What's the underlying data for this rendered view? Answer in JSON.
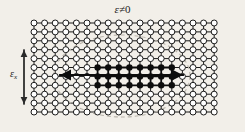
{
  "figure": {
    "kind": "lattice-diagram",
    "background_color": "#f2efe9",
    "top_label": {
      "symbol": "ε",
      "relation": "≠0",
      "full": "ε≠0"
    },
    "side_label": {
      "symbol": "ε",
      "subscript": "x",
      "full": "εx"
    }
  },
  "lattice": {
    "columns": 18,
    "rows": 11,
    "origin_x": 34,
    "origin_y": 23,
    "spacing_x": 10.6,
    "spacing_y": 8.9,
    "node_radius": 3.0,
    "node_fill": "#ffffff",
    "node_stroke": "#1a1a1a",
    "bond_color": "#1a1a1a",
    "bond_width": 1.0
  },
  "filled_cluster": {
    "description": "polaron core of filled lattice sites",
    "col_start": 6,
    "col_end": 13,
    "row_start": 5,
    "row_end": 7,
    "fill": "#0d0d0d",
    "node_radius": 3.2,
    "bond_width": 1.8
  },
  "horizontal_arrow": {
    "name": "horizontal-double-arrow",
    "x1": 60,
    "x2": 183,
    "y": 75,
    "color": "#0d0d0d",
    "width": 2.0,
    "head_length": 11,
    "head_width": 11
  },
  "vertical_arrow": {
    "name": "vertical-double-arrow",
    "x": 24,
    "y1": 50,
    "y2": 104,
    "color": "#2a2a2a",
    "width": 1.3,
    "head_length": 7,
    "head_width": 6
  },
  "dashed_ellipse": {
    "name": "deformation-region-ellipse",
    "cx": 122,
    "cy": 76,
    "rx": 68,
    "ry": 41,
    "stroke": "#b9b4ab",
    "stroke_width": 1.1,
    "dash": "4 3"
  }
}
